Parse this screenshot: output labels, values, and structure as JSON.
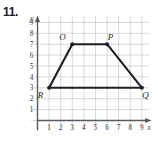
{
  "problem": {
    "number": "11."
  },
  "chart_data": {
    "type": "scatter",
    "title": "",
    "xlabel": "x",
    "ylabel": "y",
    "xlim": [
      0,
      10
    ],
    "ylim": [
      0,
      10
    ],
    "grid": true,
    "legend": false,
    "x_ticks": [
      "1",
      "2",
      "3",
      "4",
      "5",
      "6",
      "7",
      "8",
      "9"
    ],
    "x_tick_values": [
      1,
      2,
      3,
      4,
      5,
      6,
      7,
      8,
      9
    ],
    "y_ticks": [
      "1",
      "2",
      "3",
      "4",
      "5",
      "6",
      "7",
      "8",
      "9"
    ],
    "y_tick_values": [
      1,
      2,
      3,
      4,
      5,
      6,
      7,
      8,
      9
    ],
    "shape": "trapezoid",
    "points": [
      {
        "label": "R",
        "x": 1,
        "y": 3,
        "label_dx": -0.75,
        "label_dy": -0.65
      },
      {
        "label": "O",
        "x": 3,
        "y": 7,
        "label_dx": -0.85,
        "label_dy": 0.7
      },
      {
        "label": "P",
        "x": 6,
        "y": 7,
        "label_dx": 0.3,
        "label_dy": 0.7
      },
      {
        "label": "Q",
        "x": 9,
        "y": 3,
        "label_dx": 0.3,
        "label_dy": -0.65
      }
    ],
    "edges": [
      [
        "R",
        "O"
      ],
      [
        "O",
        "P"
      ],
      [
        "P",
        "Q"
      ],
      [
        "Q",
        "R"
      ]
    ]
  },
  "colors": {
    "grid": "#c9c9cf",
    "axis": "#5a5a62",
    "shape": "#1f1f28",
    "text": "#1a1a1a",
    "background": "#ffffff"
  }
}
